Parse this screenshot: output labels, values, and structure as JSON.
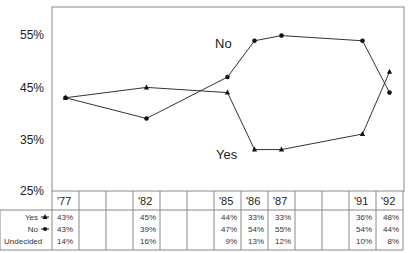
{
  "chart_data": {
    "type": "line",
    "title": "",
    "xlabel": "",
    "ylabel": "",
    "ylim": [
      25,
      58
    ],
    "y_ticks": [
      "55%",
      "45%",
      "35%",
      "25%"
    ],
    "x_columns": [
      "'77",
      "",
      "",
      "'82",
      "",
      "",
      "'85",
      "'86",
      "'87",
      "",
      "",
      "'91",
      "'92"
    ],
    "x": [
      "'77",
      "'82",
      "'85",
      "'86",
      "'87",
      "'91",
      "'92"
    ],
    "series": [
      {
        "name": "Yes",
        "marker": "triangle",
        "values": [
          43,
          45,
          44,
          33,
          33,
          36,
          48
        ]
      },
      {
        "name": "No",
        "marker": "circle",
        "values": [
          43,
          39,
          47,
          54,
          55,
          54,
          44
        ]
      }
    ],
    "table": {
      "rows": [
        {
          "label": "Yes",
          "marker": "triangle",
          "values": [
            "43%",
            "",
            "",
            "45%",
            "",
            "",
            "44%",
            "33%",
            "33%",
            "",
            "",
            "36%",
            "48%"
          ]
        },
        {
          "label": "No",
          "marker": "circle",
          "values": [
            "43%",
            "",
            "",
            "39%",
            "",
            "",
            "47%",
            "54%",
            "55%",
            "",
            "",
            "54%",
            "44%"
          ]
        },
        {
          "label": "Undecided",
          "marker": "",
          "values": [
            "14%",
            "",
            "",
            "16%",
            "",
            "",
            "9%",
            "13%",
            "12%",
            "",
            "",
            "10%",
            "8%"
          ]
        }
      ]
    },
    "annotations": [
      {
        "text": "No",
        "near": "'85-'86 upper line"
      },
      {
        "text": "Yes",
        "near": "'85-'86 lower line"
      }
    ],
    "grid": false,
    "legend": "table row labels"
  },
  "labels": {
    "y55": "55%",
    "y45": "45%",
    "y35": "35%",
    "y25": "25%",
    "no": "No",
    "yes": "Yes",
    "row_yes": "Yes",
    "row_no": "No",
    "row_undecided": "Undecided"
  }
}
